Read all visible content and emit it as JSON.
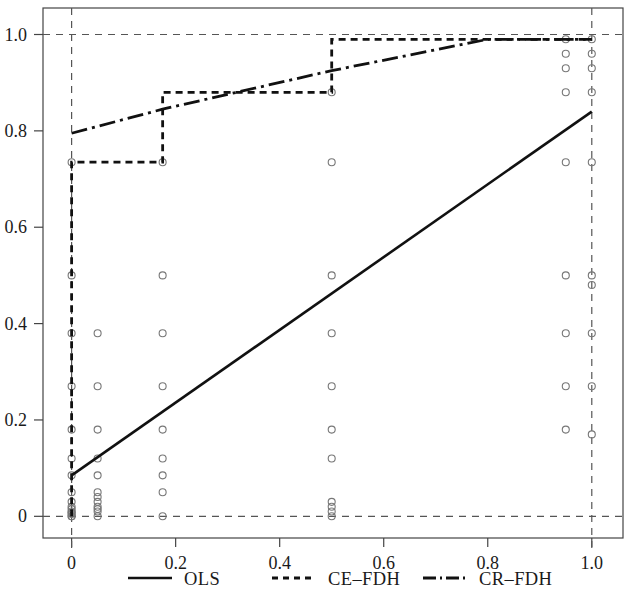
{
  "chart_data": {
    "type": "scatter",
    "title": "",
    "xlabel": "",
    "ylabel": "",
    "xlim": [
      -0.055,
      1.06
    ],
    "ylim": [
      -0.045,
      1.055
    ],
    "xticks": [
      0,
      0.2,
      0.4,
      0.6,
      0.8,
      1.0
    ],
    "xtick_labels": [
      "0",
      "0.2",
      "0.4",
      "0.6",
      "0.8",
      "1.0"
    ],
    "yticks": [
      0,
      0.2,
      0.4,
      0.6,
      0.8,
      1.0
    ],
    "ytick_labels": [
      "0",
      "0.2",
      "0.4",
      "0.6",
      "0.8",
      "1.0"
    ],
    "grid": false,
    "reference_lines": {
      "style": "dashed",
      "color": "#555555",
      "vertical_x": [
        0.0,
        1.0
      ],
      "horizontal_y": [
        0.0,
        1.0
      ]
    },
    "legend": {
      "position": "bottom",
      "entries": [
        {
          "name": "OLS",
          "style": "solid"
        },
        {
          "name": "CE–FDH",
          "style": "dotted"
        },
        {
          "name": "CR–FDH",
          "style": "dashdot"
        }
      ]
    },
    "points": {
      "marker": "open-circle",
      "color": "#777777",
      "size": 7,
      "x": [
        0.0,
        0.0,
        0.0,
        0.0,
        0.0,
        0.0,
        0.0,
        0.0,
        0.0,
        0.0,
        0.0,
        0.0,
        0.0,
        0.0,
        0.0,
        0.0,
        0.05,
        0.05,
        0.05,
        0.05,
        0.05,
        0.05,
        0.05,
        0.05,
        0.05,
        0.05,
        0.05,
        0.05,
        0.175,
        0.175,
        0.175,
        0.175,
        0.175,
        0.175,
        0.175,
        0.175,
        0.175,
        0.5,
        0.5,
        0.5,
        0.5,
        0.5,
        0.5,
        0.5,
        0.5,
        0.5,
        0.5,
        0.5,
        0.95,
        0.95,
        0.95,
        0.95,
        0.95,
        0.95,
        0.95,
        0.95,
        0.95,
        1.0,
        1.0,
        1.0,
        1.0,
        1.0,
        1.0,
        1.0,
        1.0,
        1.0,
        1.0
      ],
      "y": [
        0.735,
        0.5,
        0.38,
        0.27,
        0.18,
        0.12,
        0.085,
        0.05,
        0.03,
        0.02,
        0.015,
        0.01,
        0.008,
        0.005,
        0.0,
        0.0,
        0.38,
        0.27,
        0.18,
        0.12,
        0.085,
        0.05,
        0.04,
        0.03,
        0.02,
        0.015,
        0.01,
        0.0,
        0.735,
        0.5,
        0.38,
        0.27,
        0.18,
        0.12,
        0.085,
        0.05,
        0.0,
        0.88,
        0.735,
        0.5,
        0.38,
        0.27,
        0.18,
        0.12,
        0.03,
        0.02,
        0.01,
        0.0,
        0.99,
        0.96,
        0.93,
        0.88,
        0.735,
        0.5,
        0.38,
        0.27,
        0.18,
        0.99,
        0.96,
        0.93,
        0.88,
        0.735,
        0.5,
        0.48,
        0.38,
        0.27,
        0.17
      ]
    },
    "series": [
      {
        "name": "OLS",
        "type": "line",
        "style": "solid",
        "color": "#111111",
        "x": [
          0.0,
          1.0
        ],
        "y": [
          0.085,
          0.84
        ]
      },
      {
        "name": "CE–FDH",
        "type": "step",
        "style": "dotted",
        "color": "#111111",
        "x": [
          0.0,
          0.0,
          0.175,
          0.175,
          0.5,
          0.5,
          1.0
        ],
        "y": [
          0.0,
          0.735,
          0.735,
          0.88,
          0.88,
          0.99,
          0.99
        ]
      },
      {
        "name": "CR–FDH",
        "type": "line",
        "style": "dashdot",
        "color": "#111111",
        "x": [
          0.0,
          0.175,
          0.5,
          0.8,
          1.0
        ],
        "y": [
          0.795,
          0.845,
          0.925,
          0.99,
          0.99
        ]
      }
    ]
  },
  "axes": {
    "frame_visible": true,
    "frame_color": "#444444"
  }
}
